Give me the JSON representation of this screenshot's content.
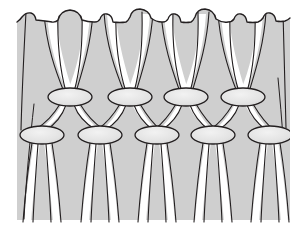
{
  "figure": {
    "title": "Knotted net fabric structure",
    "caption": ""
  },
  "canvas": {
    "width": 307,
    "height": 230,
    "background_color": "#ffffff"
  },
  "panel": {
    "label": "fabric-panel",
    "x": 17,
    "y": 10,
    "width": 273,
    "height": 210,
    "fill_color": "#cfcfcf",
    "note": "light grey fabric ground with wavy upper edge"
  },
  "style": {
    "cord_outline_color": "#231f20",
    "cord_highlight_color": "#ffffff",
    "cord_body_color": "#dcdcdc",
    "knot_fill_color": "#e3e3e3",
    "knot_outline_color": "#231f20",
    "stroke_width": 1.1,
    "knot_stroke_width": 1.3
  },
  "top_edge": {
    "label": "scalloped-selvedge",
    "baseline_y": 22,
    "bump_count": 11,
    "bump_height": 11,
    "bump_note": "rounded cord ends protrude above the fabric baseline at alternating heights",
    "bumps": [
      {
        "x": 36,
        "width": 30,
        "rise": 4
      },
      {
        "x": 70,
        "width": 22,
        "rise": 11
      },
      {
        "x": 101,
        "width": 18,
        "rise": 7
      },
      {
        "x": 130,
        "width": 24,
        "rise": 12
      },
      {
        "x": 158,
        "width": 18,
        "rise": 6
      },
      {
        "x": 186,
        "width": 24,
        "rise": 12
      },
      {
        "x": 214,
        "width": 18,
        "rise": 6
      },
      {
        "x": 243,
        "width": 24,
        "rise": 12
      },
      {
        "x": 266,
        "width": 16,
        "rise": 5
      },
      {
        "x": 284,
        "width": 18,
        "rise": 9
      },
      {
        "x": 22,
        "width": 18,
        "rise": 3
      }
    ]
  },
  "knot_rows": [
    {
      "row_index": 1,
      "label": "upper-knot-row",
      "center_y": 97,
      "knot_count": 4,
      "knot_rx": 22,
      "knot_ry": 9,
      "centers_x": [
        70,
        130,
        186,
        243
      ]
    },
    {
      "row_index": 2,
      "label": "lower-knot-row",
      "center_y": 135,
      "knot_count": 5,
      "knot_rx": 22,
      "knot_ry": 9,
      "centers_x": [
        42,
        100,
        157,
        213,
        270
      ]
    }
  ],
  "cords": {
    "label": "cord-strands",
    "count_top": 11,
    "count_bottom": 12,
    "top_anchor_y": 16,
    "bottom_anchor_y": 222,
    "note": "each cord descends, converges into a knot, and splays out again below it"
  },
  "free_ends": {
    "label": "loose-cord-ends",
    "items": [
      {
        "x_top": 34,
        "y_top": 105,
        "x_bottom": 26,
        "y_bottom": 218,
        "side": "left"
      },
      {
        "x_top": 278,
        "y_top": 80,
        "x_bottom": 284,
        "y_bottom": 140,
        "side": "right"
      }
    ]
  },
  "legend": {
    "visible": false,
    "entries": []
  },
  "labels": {
    "visible": false,
    "entries": []
  }
}
